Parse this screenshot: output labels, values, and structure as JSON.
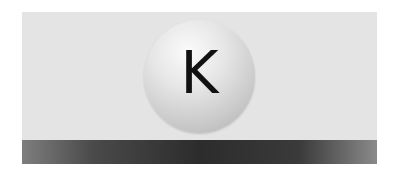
{
  "diagram": {
    "atom": {
      "symbol": "K",
      "shape": "sphere"
    },
    "surface": {
      "shape": "bar"
    },
    "colors": {
      "background": "#e4e4e4",
      "atom_highlight": "#fbfbfb",
      "atom_shadow": "#adadad",
      "surface_center": "#2c2c2c",
      "surface_edge": "#7e7e7e",
      "label": "#111111"
    }
  }
}
